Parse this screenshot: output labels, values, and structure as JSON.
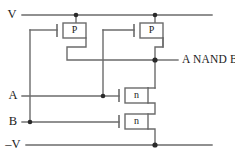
{
  "diagram": {
    "type": "transistor-level-schematic",
    "colors": {
      "wire": "#6b6b6b",
      "junction": "#2a2a2a",
      "text": "#1a1a1a",
      "background": "#ffffff"
    }
  },
  "rails": {
    "supply_positive": {
      "label": "V",
      "y": 15
    },
    "supply_negative": {
      "label": "–V",
      "y": 145
    }
  },
  "inputs": [
    {
      "label": "A",
      "y": 96
    },
    {
      "label": "B",
      "y": 122
    }
  ],
  "output": {
    "label": "A NAND B",
    "y": 60
  },
  "transistors": [
    {
      "id": "pmos-left",
      "label": "P",
      "type": "pmos",
      "x": 74,
      "y": 30
    },
    {
      "id": "pmos-right",
      "label": "P",
      "type": "pmos",
      "x": 151,
      "y": 30
    },
    {
      "id": "nmos-upper",
      "label": "n",
      "type": "nmos",
      "x": 136,
      "y": 95
    },
    {
      "id": "nmos-lower",
      "label": "n",
      "type": "nmos",
      "x": 136,
      "y": 121
    }
  ],
  "junctions": [
    {
      "id": "vdd-left-tap",
      "x": 76,
      "y": 15
    },
    {
      "id": "vdd-right-tap",
      "x": 155,
      "y": 15
    },
    {
      "id": "output-node",
      "x": 155,
      "y": 60
    },
    {
      "id": "input-a-tap",
      "x": 103,
      "y": 96
    },
    {
      "id": "input-b-tap",
      "x": 30,
      "y": 122
    },
    {
      "id": "vss-tap",
      "x": 155,
      "y": 145
    }
  ]
}
